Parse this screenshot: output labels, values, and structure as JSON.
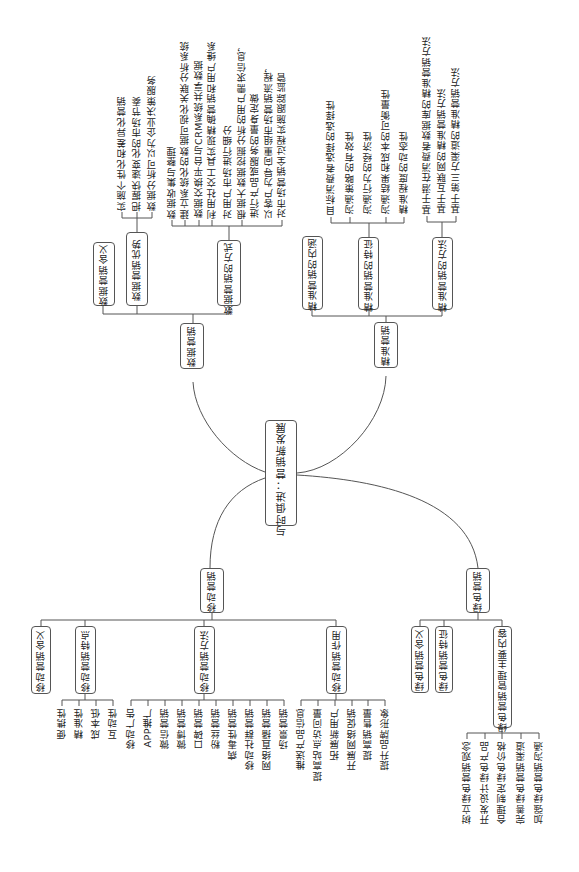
{
  "root": {
    "label": "与时俱进：营销新发展"
  },
  "branches": {
    "data_marketing": {
      "label": "数据营销",
      "children": {
        "meaning": {
          "label": "数据营销含义"
        },
        "advantages": {
          "label": "数据营销优势",
          "items": [
            "实施个性化和差异化营销",
            "把握快速变化的市场节奏",
            "数据分析可以为企业决策服务"
          ]
        },
        "methods": {
          "label": "数据营销的方式",
          "items": [
            "数据收集与整理",
            "建立系统化的数据可视化关联分析系统",
            "数据交换平台与CRM系统共享数据",
            "利用社交工具实现精确营销和用户维系",
            "对用户市场进行细分",
            "根据大数据挖掘分析的用户需求信息，",
            "进行产品或服务的量身定做",
            "以客户为导向重组市场营销流程，",
            "对市场营销全过程实施跟踪监管"
          ]
        }
      }
    },
    "precision_marketing": {
      "label": "精准营销",
      "children": {
        "connotation": {
          "label": "精准营销的内涵"
        },
        "features": {
          "label": "精准营销的特征",
          "items": [
            "目标消费者选择的选择性",
            "沟通策略的有效性",
            "沟通行为的经济性",
            "沟通结果和成本的可衡量性",
            "精准程度的动态性"
          ]
        },
        "methods": {
          "label": "精准营销的方法",
          "items": [
            "基于潜在消费者数据库的精准营销方法",
            "基于互联网的精准营销方法",
            "基于第三方渠道的精准营销方法"
          ]
        }
      }
    },
    "mobile_marketing": {
      "label": "移动营销",
      "children": {
        "meaning": {
          "label": "移动营销含义"
        },
        "features": {
          "label": "移动营销特点",
          "items": [
            "便携性",
            "精准性",
            "成本低",
            "互动性"
          ]
        },
        "methods": {
          "label": "移动营销方法",
          "items": [
            "移动广告",
            "APP推广",
            "微信营销",
            "微博营销",
            "口碑营销",
            "粉丝营销",
            "病毒性营销",
            "移动社群营销",
            "网络直播营销",
            "场景营销"
          ]
        },
        "functions": {
          "label": "移动营销作用",
          "items": [
            "推送产品信息",
            "提高站点访问量",
            "拓展新用户",
            "开展网络促销",
            "提高销售量",
            "提升品牌形象"
          ]
        }
      }
    },
    "green_marketing": {
      "label": "绿色营销",
      "children": {
        "meaning": {
          "label": "绿色营销含义"
        },
        "features": {
          "label": "绿色营销特征"
        },
        "content": {
          "label": "绿色营销管理主要内容",
          "items": [
            "树立绿色营销观念",
            "开发设计绿色产品",
            "合理制定绿色价格",
            "完善绿色营销渠道",
            "加强绿色营销沟通"
          ]
        }
      }
    }
  }
}
